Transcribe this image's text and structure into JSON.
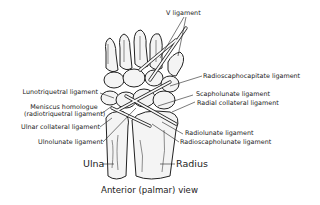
{
  "diagram": {
    "caption": "Anterior (palmar) view",
    "labels": {
      "v_ligament": "V ligament",
      "radioscaphocapitate": "Radioscaphocapitate ligament",
      "scapholunate": "Scapholunate ligament",
      "radial_collateral": "Radial collateral ligament",
      "lunotriquetral": "Lunotriquetral ligament",
      "meniscus_line1": "Meniscus homologue",
      "meniscus_line2": "(radiotriquetral ligament)",
      "ulnar_collateral": "Ulnar collateral ligament",
      "ulnolunate": "Ulnolunate ligament",
      "radiolunate": "Radiolunate ligament",
      "radioscapholunate": "Radioscapholunate ligament",
      "ulna": "Ulna",
      "radius": "Radius"
    }
  }
}
